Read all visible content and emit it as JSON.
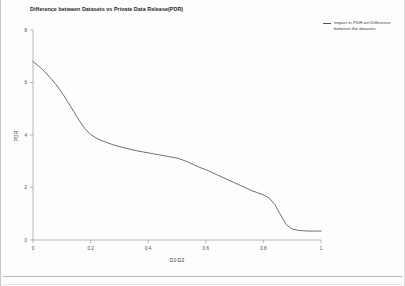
{
  "chart_data": {
    "type": "line",
    "title": "Difference between Datasets vs Private Data Release(PDR)",
    "xlabel": "D1-D2",
    "ylabel": "PDR",
    "xlim": [
      0,
      1
    ],
    "ylim": [
      0,
      8
    ],
    "xticks": [
      "0",
      "0.2",
      "0.4",
      "0.6",
      "0.8",
      "1"
    ],
    "xtick_values": [
      0,
      0.2,
      0.4,
      0.6,
      0.8,
      1
    ],
    "yticks": [
      "0",
      "2",
      "4",
      "6",
      "8"
    ],
    "ytick_values": [
      0,
      2,
      4,
      6,
      8
    ],
    "grid": false,
    "legend_position": "right",
    "legend": [
      {
        "name": "Impact in PDR wrt Difference between the datasets",
        "color": "#555555"
      }
    ],
    "series": [
      {
        "name": "Impact in PDR wrt Difference between the datasets",
        "color": "#555555",
        "x": [
          0.0,
          0.02,
          0.04,
          0.06,
          0.08,
          0.1,
          0.12,
          0.14,
          0.16,
          0.18,
          0.2,
          0.22,
          0.24,
          0.26,
          0.28,
          0.3,
          0.32,
          0.34,
          0.36,
          0.38,
          0.4,
          0.42,
          0.44,
          0.46,
          0.48,
          0.5,
          0.52,
          0.54,
          0.56,
          0.58,
          0.6,
          0.62,
          0.64,
          0.66,
          0.68,
          0.7,
          0.72,
          0.74,
          0.76,
          0.78,
          0.8,
          0.82,
          0.84,
          0.86,
          0.88,
          0.9,
          0.92,
          0.94,
          0.96,
          0.98,
          1.0
        ],
        "y": [
          6.8,
          6.62,
          6.42,
          6.18,
          5.92,
          5.62,
          5.28,
          4.92,
          4.56,
          4.24,
          4.02,
          3.88,
          3.78,
          3.7,
          3.62,
          3.56,
          3.5,
          3.45,
          3.4,
          3.36,
          3.32,
          3.28,
          3.24,
          3.2,
          3.16,
          3.12,
          3.05,
          2.96,
          2.86,
          2.76,
          2.68,
          2.58,
          2.48,
          2.38,
          2.28,
          2.18,
          2.08,
          1.98,
          1.88,
          1.8,
          1.72,
          1.6,
          1.35,
          0.95,
          0.58,
          0.42,
          0.37,
          0.35,
          0.34,
          0.34,
          0.34
        ]
      }
    ]
  },
  "axes": {
    "x_tick_labels": [
      "0",
      "0.2",
      "0.4",
      "0.6",
      "0.8",
      "1"
    ],
    "y_tick_labels": [
      "0",
      "2",
      "4",
      "6",
      "8"
    ],
    "x_axis_title": "D1-D2",
    "y_axis_title": "PDR"
  },
  "legend": {
    "entry_label": "Impact in PDR wrt Difference between the datasets"
  },
  "title": {
    "text": "Difference between Datasets vs Private Data Release(PDR)"
  }
}
